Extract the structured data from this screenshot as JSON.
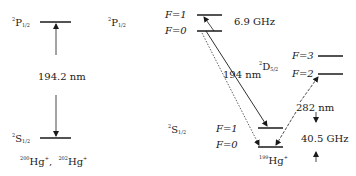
{
  "left_panel": {
    "upper_state": {
      "mult": "2",
      "term": "P",
      "j": "1/2"
    },
    "lower_state": {
      "mult": "2",
      "term": "S",
      "j": "1/2"
    },
    "transition": "194.2 nm",
    "isotope_1": {
      "mass": "200",
      "symbol": "Hg",
      "charge": "+"
    },
    "isotope_2": {
      "mass": "202",
      "symbol": "Hg",
      "charge": "+"
    },
    "separator": ","
  },
  "right_panel": {
    "p_state": {
      "mult": "2",
      "term": "P",
      "j": "1/2"
    },
    "p_levels": [
      "F=1",
      "F=0"
    ],
    "p_splitting": "6.9 GHz",
    "d_state": {
      "mult": "2",
      "term": "D",
      "j": "5/2"
    },
    "d_levels": [
      "F=3",
      "F=2"
    ],
    "s_state": {
      "mult": "2",
      "term": "S",
      "j": "1/2"
    },
    "s_levels": [
      "F=1",
      "F=0"
    ],
    "uv_transition": "194 nm",
    "d_transition": "282 nm",
    "s_splitting": "40.5  GHz",
    "isotope": {
      "mass": "199",
      "symbol": "Hg",
      "charge": "+"
    }
  }
}
